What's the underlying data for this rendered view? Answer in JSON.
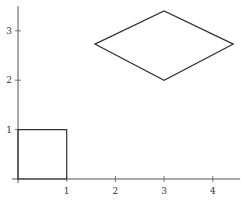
{
  "chart_data": {
    "type": "line",
    "title": "",
    "xlabel": "",
    "ylabel": "",
    "xlim": [
      0,
      4.5
    ],
    "ylim": [
      0,
      3.5
    ],
    "grid": false,
    "legend": null,
    "x_ticks": [
      1,
      2,
      3,
      4
    ],
    "x_tick_labels": [
      "1",
      "2",
      "3",
      "4"
    ],
    "y_ticks": [
      1,
      2,
      3
    ],
    "y_tick_labels": [
      "1",
      "2",
      "3"
    ],
    "series": [
      {
        "name": "square",
        "closed": true,
        "points": [
          [
            0,
            0
          ],
          [
            1,
            0
          ],
          [
            1,
            1
          ],
          [
            0,
            1
          ]
        ]
      },
      {
        "name": "rhombus",
        "closed": true,
        "points": [
          [
            1.58,
            2.73
          ],
          [
            3,
            3.4
          ],
          [
            4.42,
            2.73
          ],
          [
            3,
            2.0
          ]
        ]
      }
    ],
    "colors": {
      "axis": "#555555",
      "shape": "#333333"
    }
  }
}
